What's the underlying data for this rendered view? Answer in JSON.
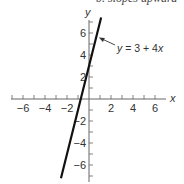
{
  "top_cut_text": "b. slopes upward",
  "chart_data": {
    "type": "line",
    "title": "",
    "xlabel": "x",
    "ylabel": "y",
    "xlim": [
      -7,
      7
    ],
    "ylim": [
      -7,
      7
    ],
    "grid": false,
    "x_ticks": [
      -6,
      -4,
      -2,
      2,
      4,
      6
    ],
    "y_ticks": [
      -6,
      -4,
      -2,
      2,
      4,
      6
    ],
    "series": [
      {
        "name": "y = 3 + 4x",
        "equation": {
          "intercept": 3,
          "slope": 4
        },
        "x": [
          -2.55,
          1.1
        ],
        "y": [
          -7.2,
          7.4
        ]
      }
    ],
    "annotations": [
      {
        "text": "y = 3 + 4x",
        "arrow_to": [
          0.9,
          5.6
        ]
      }
    ]
  },
  "style": {
    "line_color": "#111111",
    "axis_color": "#666666",
    "text_color": "#333333"
  }
}
